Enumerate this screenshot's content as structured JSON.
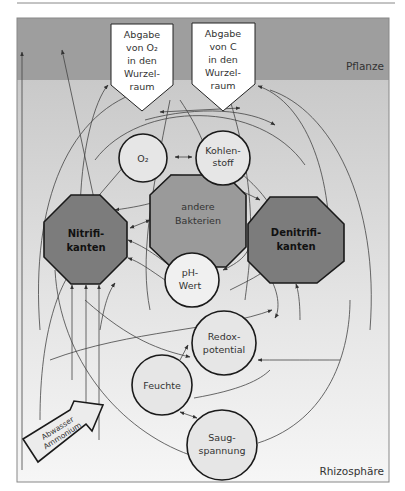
{
  "zones": {
    "top": "Pflanze",
    "bottom": "Rhizosphäre"
  },
  "sources": [
    {
      "id": "o2-release",
      "lines": [
        "Abgabe",
        "von O₂",
        "in den",
        "Wurzel-",
        "raum"
      ]
    },
    {
      "id": "c-release",
      "lines": [
        "Abgabe",
        "von C",
        "in den",
        "Wurzel-",
        "raum"
      ]
    }
  ],
  "octagons": [
    {
      "id": "nitrifikanten",
      "lines": [
        "Nitrifi-",
        "kanten"
      ],
      "bold": true,
      "fill": "#7c7c7c"
    },
    {
      "id": "andere-bakterien",
      "lines": [
        "andere",
        "Bakterien"
      ],
      "bold": false,
      "fill": "#9a9a9a"
    },
    {
      "id": "denitrifikanten",
      "lines": [
        "Denitrifi-",
        "kanten"
      ],
      "bold": true,
      "fill": "#7c7c7c"
    }
  ],
  "circles": [
    {
      "id": "o2",
      "lines": [
        "O₂"
      ]
    },
    {
      "id": "kohlenstoff",
      "lines": [
        "Kohlen-",
        "stoff"
      ]
    },
    {
      "id": "ph-wert",
      "lines": [
        "pH-",
        "Wert"
      ]
    },
    {
      "id": "redoxpotential",
      "lines": [
        "Redox-",
        "potential"
      ]
    },
    {
      "id": "feuchte",
      "lines": [
        "Feuchte"
      ]
    },
    {
      "id": "saugspannung",
      "lines": [
        "Saug-",
        "spannung"
      ]
    }
  ],
  "input_arrow": {
    "lines": [
      "Abwasser",
      "Ammonium"
    ]
  },
  "colors": {
    "plant_band": "#9e9e9e",
    "rhizo_top": "#cfcfcf",
    "rhizo_bottom": "#f2f2f2",
    "octagon_dark": "#7c7c7c",
    "octagon_mid": "#9a9a9a",
    "circle_fill": "#e6e6e6",
    "stroke": "#1a1a1a"
  }
}
